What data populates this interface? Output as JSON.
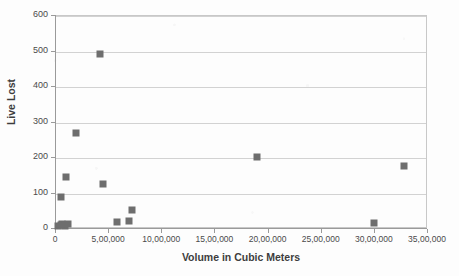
{
  "chart_data": {
    "type": "scatter",
    "title": "",
    "xlabel": "Volume in Cubic Meters",
    "ylabel": "Live Lost",
    "xlim": [
      0,
      3500000
    ],
    "ylim": [
      0,
      600
    ],
    "grid": true,
    "legend": false,
    "marker_color": "#6e6e6e",
    "marker_shape": "square",
    "x_tick_labels": [
      "0",
      "5,00,000",
      "10,00,000",
      "15,00,000",
      "20,00,000",
      "25,00,000",
      "30,00,000",
      "35,00,000"
    ],
    "x_tick_values": [
      0,
      500000,
      1000000,
      1500000,
      2000000,
      2500000,
      3000000,
      3500000
    ],
    "y_tick_labels": [
      "0",
      "100",
      "200",
      "300",
      "400",
      "500",
      "600"
    ],
    "y_tick_values": [
      0,
      100,
      200,
      300,
      400,
      500,
      600
    ],
    "points": [
      {
        "x": 30000,
        "y": 5
      },
      {
        "x": 55000,
        "y": 8
      },
      {
        "x": 70000,
        "y": 12
      },
      {
        "x": 95000,
        "y": 6
      },
      {
        "x": 120000,
        "y": 10
      },
      {
        "x": 60000,
        "y": 88
      },
      {
        "x": 100000,
        "y": 143
      },
      {
        "x": 200000,
        "y": 268
      },
      {
        "x": 420000,
        "y": 489
      },
      {
        "x": 450000,
        "y": 123
      },
      {
        "x": 580000,
        "y": 18
      },
      {
        "x": 700000,
        "y": 21
      },
      {
        "x": 720000,
        "y": 50
      },
      {
        "x": 1900000,
        "y": 201
      },
      {
        "x": 3000000,
        "y": 14
      },
      {
        "x": 3280000,
        "y": 175
      }
    ]
  }
}
